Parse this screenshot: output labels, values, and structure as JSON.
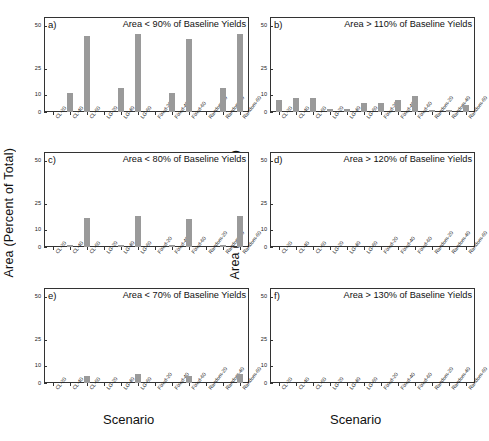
{
  "figure": {
    "ylabel_left": "Area (Percent of Total)",
    "ylabel_right": "Area (Percent of Total)",
    "xlabel_col1": "Scenario",
    "xlabel_col2": "Scenario",
    "bar_color": "#9a9a9a",
    "axis_color": "#333333"
  },
  "chart_data": [
    {
      "type": "bar",
      "panel": "a)",
      "title": "Area < 90% of Baseline Yields",
      "xlabel": "Scenario",
      "ylabel": "Area (Percent of Total)",
      "categories": [
        "CL-20",
        "CL-40",
        "CL-60",
        "LG-20",
        "LG-40",
        "LG-60",
        "Fixed-20",
        "Fixed-40",
        "Fixed-60",
        "Random-20",
        "Random-40",
        "Random-60"
      ],
      "values": [
        0,
        11,
        44,
        0,
        14,
        45,
        0,
        11,
        42,
        0,
        14,
        45
      ],
      "yticks": [
        0,
        10,
        25,
        50
      ],
      "ylim": [
        0,
        55
      ],
      "grid": false,
      "legend": "none"
    },
    {
      "type": "bar",
      "panel": "b)",
      "title": "Area > 110% of Baseline Yields",
      "xlabel": "Scenario",
      "ylabel": "Area (Percent of Total)",
      "categories": [
        "CL-20",
        "CL-40",
        "CL-60",
        "LG-20",
        "LG-40",
        "LG-60",
        "Fixed-20",
        "Fixed-40",
        "Fixed-60",
        "Random-20",
        "Random-40",
        "Random-60"
      ],
      "values": [
        7,
        8,
        8,
        2,
        2,
        5,
        5,
        7,
        9,
        1,
        1,
        4
      ],
      "yticks": [
        0,
        10,
        25,
        50
      ],
      "ylim": [
        0,
        55
      ],
      "grid": false,
      "legend": "none"
    },
    {
      "type": "bar",
      "panel": "c)",
      "title": "Area < 80% of Baseline Yields",
      "xlabel": "Scenario",
      "ylabel": "Area (Percent of Total)",
      "categories": [
        "CL-20",
        "CL-40",
        "CL-60",
        "LG-20",
        "LG-40",
        "LG-60",
        "Fixed-20",
        "Fixed-40",
        "Fixed-60",
        "Random-20",
        "Random-40",
        "Random-60"
      ],
      "values": [
        0,
        1,
        17,
        0,
        1,
        18,
        0,
        1,
        16,
        0,
        1,
        18
      ],
      "yticks": [
        0,
        10,
        25,
        50
      ],
      "ylim": [
        0,
        55
      ],
      "grid": false,
      "legend": "none"
    },
    {
      "type": "bar",
      "panel": "d)",
      "title": "Area > 120% of Baseline Yields",
      "xlabel": "Scenario",
      "ylabel": "Area (Percent of Total)",
      "categories": [
        "CL-20",
        "CL-40",
        "CL-60",
        "LG-20",
        "LG-40",
        "LG-60",
        "Fixed-20",
        "Fixed-40",
        "Fixed-60",
        "Random-20",
        "Random-40",
        "Random-60"
      ],
      "values": [
        0,
        0,
        0,
        0,
        0,
        0,
        0,
        0,
        0,
        0,
        0,
        0
      ],
      "yticks": [
        0,
        10,
        25,
        50
      ],
      "ylim": [
        0,
        55
      ],
      "grid": false,
      "legend": "none"
    },
    {
      "type": "bar",
      "panel": "e)",
      "title": "Area < 70% of Baseline Yields",
      "xlabel": "Scenario",
      "ylabel": "Area (Percent of Total)",
      "categories": [
        "CL-20",
        "CL-40",
        "CL-60",
        "LG-20",
        "LG-40",
        "LG-60",
        "Fixed-20",
        "Fixed-40",
        "Fixed-60",
        "Random-20",
        "Random-40",
        "Random-60"
      ],
      "values": [
        0,
        0,
        4,
        0,
        0,
        5,
        0,
        0,
        4,
        0,
        0,
        5
      ],
      "yticks": [
        0,
        10,
        25,
        50
      ],
      "ylim": [
        0,
        55
      ],
      "grid": false,
      "legend": "none"
    },
    {
      "type": "bar",
      "panel": "f)",
      "title": "Area > 130% of Baseline Yields",
      "xlabel": "Scenario",
      "ylabel": "Area (Percent of Total)",
      "categories": [
        "CL-20",
        "CL-40",
        "CL-60",
        "LG-20",
        "LG-40",
        "LG-60",
        "Fixed-20",
        "Fixed-40",
        "Fixed-60",
        "Random-20",
        "Random-40",
        "Random-60"
      ],
      "values": [
        0,
        0,
        0,
        0,
        0,
        0,
        0,
        0,
        0,
        0,
        0,
        0
      ],
      "yticks": [
        0,
        10,
        25,
        50
      ],
      "ylim": [
        0,
        55
      ],
      "grid": false,
      "legend": "none"
    }
  ]
}
